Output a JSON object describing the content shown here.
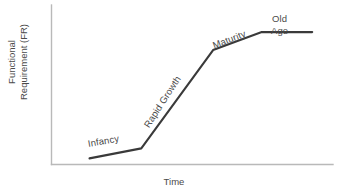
{
  "chart_data": {
    "type": "line",
    "title": "",
    "xlabel": "Time",
    "ylabel_line1": "Functional",
    "ylabel_line2": "Requirement (FR)",
    "grid": false,
    "legend": "none",
    "xlim": [
      0,
      100
    ],
    "ylim": [
      0,
      100
    ],
    "axis_ticks": [],
    "series": [
      {
        "name": "Functional Requirement",
        "x": [
          13.5,
          31.9,
          57.4,
          74.7,
          92.6
        ],
        "y": [
          3.8,
          10.1,
          71.7,
          83.0,
          83.0
        ],
        "color": "#3a3a3a"
      }
    ],
    "annotations": [
      {
        "name": "infancy",
        "text": "Infancy",
        "segment": "first-plateau",
        "rotation_deg": -10
      },
      {
        "name": "rapid-growth",
        "text": "Rapid Growth",
        "segment": "steep-rise",
        "rotation_deg": -57
      },
      {
        "name": "maturity",
        "text": "Maturity",
        "segment": "tapering-rise",
        "rotation_deg": -21
      },
      {
        "name": "old-age",
        "text_line1": "Old",
        "text_line2": "Age",
        "segment": "final-plateau",
        "rotation_deg": 0
      }
    ],
    "colors": {
      "curve": "#3a3a3a",
      "axis": "#b9b9b9",
      "text": "#4a4a4a",
      "background": "#ffffff"
    }
  },
  "axes": {
    "x_title": "Time",
    "y_title_line1": "Functional",
    "y_title_line2": "Requirement (FR)"
  },
  "labels": {
    "infancy": "Infancy",
    "rapid_growth": "Rapid Growth",
    "maturity": "Maturity",
    "old": "Old",
    "age": "Age"
  }
}
